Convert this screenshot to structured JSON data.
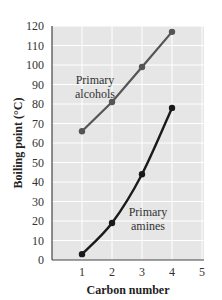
{
  "chart_data": {
    "type": "line",
    "title": "",
    "xlabel": "Carbon number",
    "ylabel": "Boiling point (°C)",
    "xlim": [
      0,
      5
    ],
    "ylim": [
      0,
      120
    ],
    "x_ticks": [
      1,
      2,
      3,
      4,
      5
    ],
    "y_ticks": [
      0,
      10,
      20,
      30,
      40,
      50,
      60,
      70,
      80,
      90,
      100,
      110,
      120
    ],
    "grid": true,
    "legend": "none (inline annotations)",
    "series": [
      {
        "name": "Primary alcohols",
        "x": [
          1,
          2,
          3,
          4
        ],
        "values": [
          66,
          81,
          99,
          117
        ],
        "color": "#555555",
        "marker": "circle",
        "line": "straight"
      },
      {
        "name": "Primary amines",
        "x": [
          1,
          2,
          3,
          4
        ],
        "values": [
          3,
          19,
          44,
          78
        ],
        "color": "#1a1a1a",
        "marker": "circle",
        "line": "smooth"
      }
    ],
    "annotations": [
      {
        "text_lines": [
          "Primary",
          "alcohols"
        ],
        "near_series": "Primary alcohols"
      },
      {
        "text_lines": [
          "Primary",
          "amines"
        ],
        "near_series": "Primary amines"
      }
    ]
  },
  "labels": {
    "xlabel": "Carbon number",
    "ylabel": "Boiling point (°C)",
    "alcohols_line1": "Primary",
    "alcohols_line2": "alcohols",
    "amines_line1": "Primary",
    "amines_line2": "amines"
  },
  "colors": {
    "plot_bg": "#e6e6e6",
    "grid": "#ffffff",
    "axis": "#444444"
  }
}
